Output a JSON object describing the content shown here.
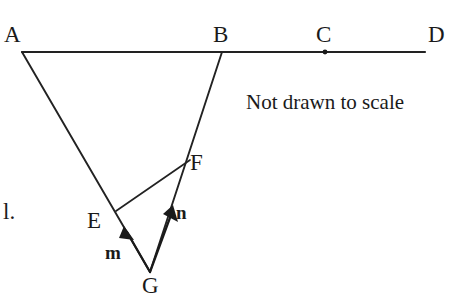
{
  "figure": {
    "background": "#ffffff",
    "stroke_color": "#222222",
    "stroke_width": 2,
    "note": "Not drawn to scale",
    "stray_text": "l.",
    "points": {
      "A": {
        "label": "A",
        "x": 22,
        "y": 52
      },
      "B": {
        "label": "B",
        "x": 222,
        "y": 52
      },
      "C": {
        "label": "C",
        "x": 325,
        "y": 52
      },
      "D": {
        "label": "D",
        "x": 425,
        "y": 52
      },
      "E": {
        "label": "E",
        "x": 118,
        "y": 212
      },
      "F": {
        "label": "F",
        "x": 186,
        "y": 163
      },
      "G": {
        "label": "G",
        "x": 150,
        "y": 272
      }
    },
    "vectors": {
      "m": {
        "label": "m",
        "from": "G",
        "to": "E"
      },
      "n": {
        "label": "n",
        "from": "G",
        "to": "F"
      }
    },
    "segments": [
      {
        "name": "line-AD",
        "from": "A",
        "to": "D"
      },
      {
        "name": "line-AG",
        "from": "A",
        "to": "G"
      },
      {
        "name": "line-BG",
        "from": "B",
        "to": "G"
      },
      {
        "name": "segment-EF",
        "from": "E",
        "to": "F"
      }
    ]
  }
}
